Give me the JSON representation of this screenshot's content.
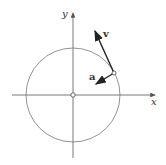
{
  "figure": {
    "type": "circular-motion-diagram",
    "axes": {
      "x_label": "x",
      "y_label": "y"
    },
    "circle": {
      "center": [
        73,
        95
      ],
      "radius": 47
    },
    "point": {
      "position": [
        114,
        73
      ],
      "description": "particle on circle"
    },
    "vectors": [
      {
        "label": "v",
        "meaning": "velocity (tangent to circle)",
        "from": [
          114,
          73
        ],
        "to": [
          95,
          31
        ]
      },
      {
        "label": "a",
        "meaning": "acceleration (toward center)",
        "from": [
          114,
          73
        ],
        "to": [
          96,
          85
        ]
      }
    ],
    "colors": {
      "axis": "#555555",
      "circle": "#777777",
      "vector": "#222222"
    }
  }
}
